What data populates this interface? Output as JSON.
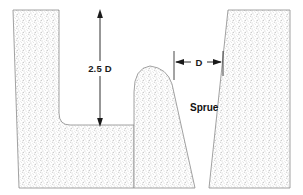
{
  "diagram": {
    "labels": {
      "depth_dimension": "2.5 D",
      "width_dimension": "D",
      "sprue": "Sprue"
    },
    "colors": {
      "background": "#ffffff",
      "sand_stipple": "#9a9a9a",
      "outline": "#8a8a8a",
      "annotation": "#1a1a1a"
    },
    "annotations": [
      {
        "name": "depth-dimension",
        "text": "2.5 D",
        "orientation": "vertical",
        "meaning": "cavity depth equals 2.5 times sprue diameter D",
        "arrows": "both-ends"
      },
      {
        "name": "width-dimension",
        "text": "D",
        "orientation": "horizontal",
        "meaning": "sprue top opening diameter D",
        "arrows": "both-ends-outward"
      },
      {
        "name": "sprue-label",
        "text": "Sprue",
        "orientation": "horizontal",
        "meaning": "tapered vertical channel feeding the mold"
      }
    ],
    "regions": [
      {
        "name": "left-sand-block",
        "fill": "sand-stipple"
      },
      {
        "name": "center-sand-ridge",
        "fill": "sand-stipple"
      },
      {
        "name": "right-sand-block",
        "fill": "sand-stipple"
      },
      {
        "name": "mold-cavity",
        "fill": "white"
      },
      {
        "name": "sprue-channel",
        "fill": "white"
      }
    ]
  }
}
